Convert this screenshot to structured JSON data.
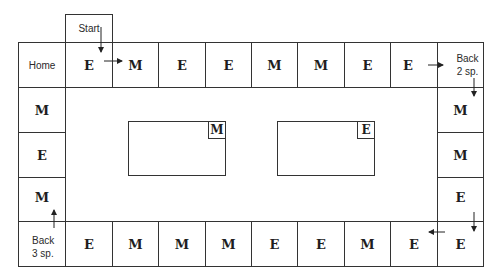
{
  "diagram": {
    "type": "board-game-path",
    "start_label": "Start",
    "top_row": [
      {
        "label": "Home",
        "kind": "label"
      },
      {
        "label": "E",
        "kind": "letter"
      },
      {
        "label": "M",
        "kind": "letter"
      },
      {
        "label": "E",
        "kind": "letter"
      },
      {
        "label": "E",
        "kind": "letter"
      },
      {
        "label": "M",
        "kind": "letter"
      },
      {
        "label": "M",
        "kind": "letter"
      },
      {
        "label": "E",
        "kind": "letter"
      },
      {
        "label": "E",
        "kind": "letter"
      },
      {
        "label": "Back\n2 sp.",
        "kind": "label"
      }
    ],
    "right_column": [
      {
        "label": "M",
        "kind": "letter"
      },
      {
        "label": "M",
        "kind": "letter"
      },
      {
        "label": "E",
        "kind": "letter"
      }
    ],
    "bottom_row": [
      {
        "label": "Back\n3 sp.",
        "kind": "label"
      },
      {
        "label": "E",
        "kind": "letter"
      },
      {
        "label": "M",
        "kind": "letter"
      },
      {
        "label": "M",
        "kind": "letter"
      },
      {
        "label": "M",
        "kind": "letter"
      },
      {
        "label": "E",
        "kind": "letter"
      },
      {
        "label": "E",
        "kind": "letter"
      },
      {
        "label": "M",
        "kind": "letter"
      },
      {
        "label": "E",
        "kind": "letter"
      },
      {
        "label": "E",
        "kind": "letter"
      }
    ],
    "left_column": [
      {
        "label": "M",
        "kind": "letter"
      },
      {
        "label": "E",
        "kind": "letter"
      },
      {
        "label": "M",
        "kind": "letter"
      }
    ],
    "decks": [
      {
        "name": "M card pile",
        "tag": "M"
      },
      {
        "name": "E card pile",
        "tag": "E"
      }
    ],
    "colors": {
      "line": "#333333",
      "text": "#1e1e1e",
      "background": "#ffffff"
    }
  }
}
